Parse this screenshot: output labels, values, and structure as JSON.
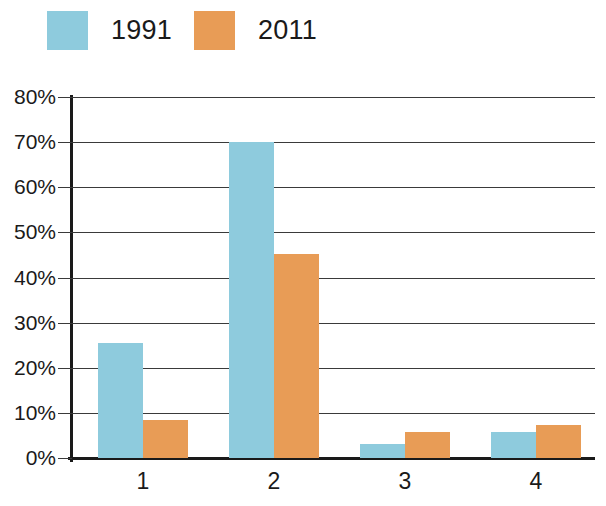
{
  "legend": {
    "position": "top-left",
    "entries": [
      {
        "label": "1991",
        "color": "#8ecbdd",
        "swatch_name": "legend-swatch-1991"
      },
      {
        "label": "2011",
        "color": "#e89c56",
        "swatch_name": "legend-swatch-2011"
      }
    ]
  },
  "axes": {
    "y_ticks": [
      "80%",
      "70%",
      "60%",
      "50%",
      "40%",
      "30%",
      "20%",
      "10%",
      "0%"
    ],
    "x_ticks": [
      "1",
      "2",
      "3",
      "4"
    ]
  },
  "chart_data": {
    "type": "bar",
    "title": "",
    "subtitle": "",
    "xlabel": "",
    "ylabel": "",
    "categories": [
      "1",
      "2",
      "3",
      "4"
    ],
    "series": [
      {
        "name": "1991",
        "color": "#8ecbdd",
        "values": [
          25.5,
          70,
          3,
          5.8
        ]
      },
      {
        "name": "2011",
        "color": "#e89c56",
        "values": [
          8.5,
          45.2,
          5.8,
          7.3
        ]
      }
    ],
    "ylim": [
      0,
      80
    ],
    "ytick_values": [
      0,
      10,
      20,
      30,
      40,
      50,
      60,
      70,
      80
    ],
    "ytick_labels": [
      "0%",
      "10%",
      "20%",
      "30%",
      "40%",
      "50%",
      "60%",
      "70%",
      "80%"
    ],
    "yunit": "%",
    "grid": true,
    "grid_axis": "y",
    "legend_position": "top-left",
    "bar_group_count": 4,
    "bars_per_group": 2,
    "annotations": []
  }
}
